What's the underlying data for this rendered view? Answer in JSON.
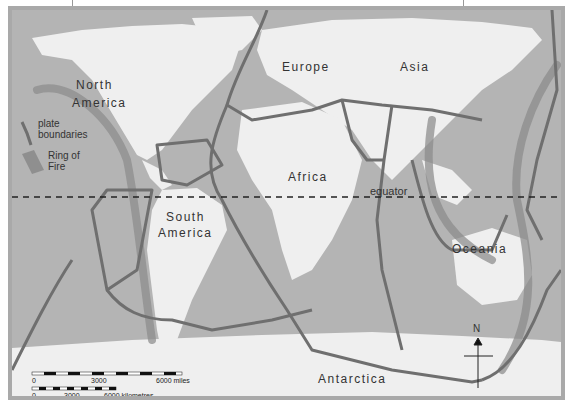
{
  "map": {
    "title": "Tectonic plate boundaries and Ring of Fire",
    "continents": {
      "north_america_1": "North",
      "north_america_2": "America",
      "south_america_1": "South",
      "south_america_2": "America",
      "europe": "Europe",
      "asia": "Asia",
      "africa": "Africa",
      "oceania": "Oceania",
      "antarctica": "Antarctica"
    },
    "equator_label": "equator",
    "legend": {
      "plate_boundaries_1": "plate",
      "plate_boundaries_2": "boundaries",
      "ring_of_fire_1": "Ring of",
      "ring_of_fire_2": "Fire"
    },
    "scale": {
      "miles": {
        "zero": "0",
        "mid": "3000",
        "end": "6000 miles"
      },
      "km": {
        "zero": "0",
        "mid": "3000",
        "end": "6000 kilometres"
      }
    },
    "compass": {
      "label": "N"
    },
    "colors": {
      "ocean": "#b4b4b4",
      "land": "#efefef",
      "boundary": "#6f6f6f",
      "ring_of_fire": "#8a8a8a",
      "frame": "#a9a9a9"
    }
  }
}
